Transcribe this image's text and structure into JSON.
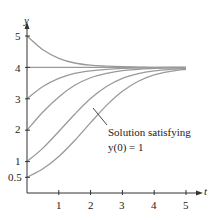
{
  "chart_data": {
    "type": "line",
    "title": "",
    "xlabel": "t",
    "ylabel": "y",
    "xlim": [
      0,
      5.4
    ],
    "ylim": [
      0,
      5.3
    ],
    "grid": false,
    "legend": "none",
    "x_ticks": [
      "1",
      "2",
      "3",
      "4",
      "5"
    ],
    "y_ticks": [
      "0.5",
      "1",
      "2",
      "3",
      "4",
      "5"
    ],
    "x": [
      0,
      0.5,
      1,
      1.5,
      2,
      2.5,
      3,
      3.5,
      4,
      4.5,
      5,
      5.5
    ],
    "series": [
      {
        "name": "y(0)=0.5",
        "values": [
          0.5,
          0.77,
          1.16,
          1.67,
          2.24,
          2.79,
          3.24,
          3.56,
          3.76,
          3.87,
          3.94,
          3.97
        ]
      },
      {
        "name": "y(0)=1",
        "values": [
          1,
          1.43,
          1.96,
          2.51,
          3.01,
          3.39,
          3.65,
          3.8,
          3.89,
          3.94,
          3.97,
          3.98
        ]
      },
      {
        "name": "y(0)=2",
        "values": [
          2,
          2.58,
          3.06,
          3.43,
          3.67,
          3.81,
          3.9,
          3.94,
          3.97,
          3.98,
          3.99,
          4.0
        ]
      },
      {
        "name": "y(0)=3",
        "values": [
          3,
          3.39,
          3.65,
          3.81,
          3.89,
          3.94,
          3.97,
          3.98,
          3.99,
          4.0,
          4.0,
          4.0
        ]
      },
      {
        "name": "y(0)=4",
        "values": [
          4,
          4,
          4,
          4,
          4,
          4,
          4,
          4,
          4,
          4,
          4,
          4
        ]
      },
      {
        "name": "y(0)=5",
        "values": [
          5,
          4.56,
          4.29,
          4.14,
          4.07,
          4.04,
          4.02,
          4.01,
          4.0,
          4.0,
          4.0,
          4.0
        ]
      }
    ],
    "annotations": [
      {
        "text_line1": "Solution satisfying",
        "text_line2": "y(0) = 1",
        "points_to_series": "y(0)=1"
      }
    ],
    "colors": {
      "curve": "#9a9a9a",
      "axis": "#333333",
      "text": "#222222"
    }
  },
  "labels": {
    "y_axis": "y",
    "x_axis": "t",
    "annotation_line1": "Solution satisfying",
    "annotation_line2": "y(0) = 1",
    "y_tick_labels": [
      "5",
      "4",
      "3",
      "2",
      "1",
      "0.5"
    ],
    "x_tick_labels": [
      "1",
      "2",
      "3",
      "4",
      "5"
    ]
  }
}
